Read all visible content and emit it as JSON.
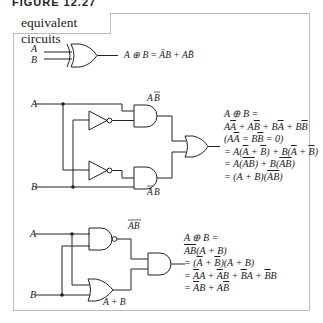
{
  "figure_label": "FIGURE 12.27",
  "panel_title": "equivalent circuits",
  "xor_symbol": {
    "inputs": [
      "A",
      "B"
    ],
    "expression": "A ⊕ B = ĀB + AB̄"
  },
  "circuit_1": {
    "inputs": [
      "A",
      "B"
    ],
    "gates": [
      "NOT",
      "NOT",
      "AND",
      "AND",
      "OR"
    ],
    "labels": {
      "top_and_output": "AB̄",
      "bottom_and_output": "ĀB"
    },
    "derivation": [
      "A ⊕ B =",
      "AĀ + AB̄ + BĀ + BB̄",
      "(AĀ = BB̄ = 0)",
      "= A(Ā + B̄) + B(Ā + B̄)",
      "= A(AB̄̄) + B(AB̄̄)",
      "= (A + B)(AB̄̄)"
    ]
  },
  "circuit_2": {
    "inputs": [
      "A",
      "B"
    ],
    "gates": [
      "NAND",
      "OR",
      "AND"
    ],
    "labels": {
      "nand_output": "AB (overlined)",
      "or_output": "A + B"
    },
    "derivation": [
      "A ⊕ B =",
      "AB̄̄(A + B)",
      "= (Ā + B̄)(A + B)",
      "= ĀA + ĀB + B̄A + B̄B",
      "= ĀB + AB̄"
    ]
  }
}
